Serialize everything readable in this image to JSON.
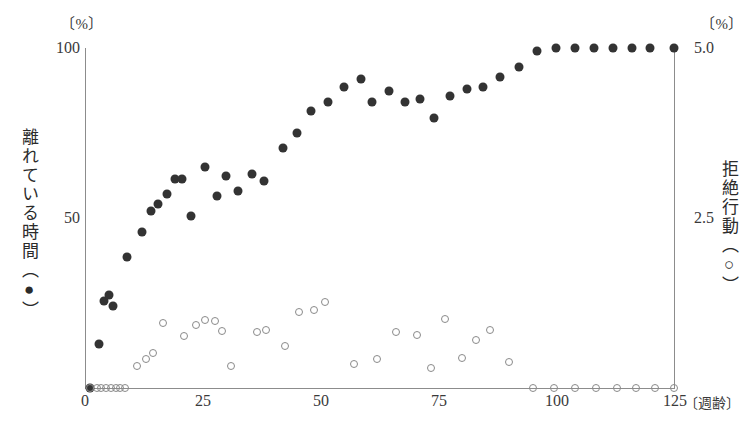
{
  "chart_data": {
    "type": "scatter",
    "title": "",
    "xlabel": "週齢",
    "xunit_label": "〔週齢〕",
    "xlim": [
      0,
      125
    ],
    "xticks": [
      0,
      25,
      50,
      75,
      100,
      125
    ],
    "xtick_labels": [
      "0",
      "25",
      "50",
      "75",
      "100",
      "125"
    ],
    "grid": false,
    "legend_position": "axis-titles",
    "axes": [
      {
        "id": "left",
        "unit": "〔%〕",
        "title": "離れている時間（●）",
        "title_text": "離れている時間",
        "marker": "●",
        "ylim": [
          0,
          100
        ],
        "yticks": [
          0,
          50,
          100
        ],
        "ytick_labels": [
          "0",
          "50",
          "100"
        ]
      },
      {
        "id": "right",
        "unit": "〔%〕",
        "title": "拒絶行動（○）",
        "title_text": "拒絶行動",
        "marker": "○",
        "ylim": [
          0,
          5.0
        ],
        "yticks": [
          2.5,
          5.0
        ],
        "ytick_labels": [
          "2.5",
          "5.0"
        ]
      }
    ],
    "series": [
      {
        "name": "離れている時間",
        "marker": "filled-circle",
        "color": "#333333",
        "axis": "left",
        "points": [
          [
            1.0,
            0.0
          ],
          [
            3.0,
            13.0
          ],
          [
            4.0,
            25.5
          ],
          [
            5.0,
            27.5
          ],
          [
            6.0,
            24.0
          ],
          [
            9.0,
            38.5
          ],
          [
            12.0,
            46.0
          ],
          [
            14.0,
            52.0
          ],
          [
            15.5,
            54.0
          ],
          [
            17.5,
            57.0
          ],
          [
            19.0,
            61.5
          ],
          [
            20.5,
            61.5
          ],
          [
            22.5,
            50.5
          ],
          [
            25.5,
            65.0
          ],
          [
            28.0,
            56.5
          ],
          [
            30.0,
            62.5
          ],
          [
            32.5,
            58.0
          ],
          [
            35.5,
            63.0
          ],
          [
            38.0,
            61.0
          ],
          [
            42.0,
            70.5
          ],
          [
            45.0,
            75.0
          ],
          [
            48.0,
            81.5
          ],
          [
            51.5,
            84.0
          ],
          [
            55.0,
            88.5
          ],
          [
            58.5,
            91.0
          ],
          [
            61.0,
            84.0
          ],
          [
            64.5,
            87.5
          ],
          [
            68.0,
            84.0
          ],
          [
            71.0,
            85.0
          ],
          [
            74.0,
            79.5
          ],
          [
            77.5,
            86.0
          ],
          [
            81.0,
            88.0
          ],
          [
            84.5,
            88.5
          ],
          [
            88.0,
            91.5
          ],
          [
            92.0,
            94.5
          ],
          [
            96.0,
            99.0
          ],
          [
            100.0,
            100.0
          ],
          [
            104.0,
            100.0
          ],
          [
            108.0,
            100.0
          ],
          [
            112.0,
            100.0
          ],
          [
            116.0,
            100.0
          ],
          [
            120.0,
            100.0
          ],
          [
            125.0,
            100.0
          ]
        ]
      },
      {
        "name": "拒絶行動",
        "marker": "open-circle",
        "color": "#8a8a8a",
        "axis": "right",
        "points": [
          [
            1.0,
            0.0
          ],
          [
            2.5,
            0.0
          ],
          [
            3.5,
            0.0
          ],
          [
            4.5,
            0.0
          ],
          [
            5.5,
            0.0
          ],
          [
            6.5,
            0.0
          ],
          [
            7.5,
            0.0
          ],
          [
            8.5,
            0.0
          ],
          [
            11.0,
            0.32
          ],
          [
            13.0,
            0.42
          ],
          [
            14.5,
            0.52
          ],
          [
            16.5,
            0.95
          ],
          [
            21.0,
            0.76
          ],
          [
            23.5,
            0.92
          ],
          [
            25.5,
            1.0
          ],
          [
            27.5,
            0.98
          ],
          [
            29.0,
            0.84
          ],
          [
            31.0,
            0.33
          ],
          [
            36.5,
            0.82
          ],
          [
            38.5,
            0.86
          ],
          [
            42.5,
            0.62
          ],
          [
            45.5,
            1.12
          ],
          [
            48.5,
            1.15
          ],
          [
            51.0,
            1.27
          ],
          [
            57.0,
            0.36
          ],
          [
            62.0,
            0.42
          ],
          [
            66.0,
            0.82
          ],
          [
            70.5,
            0.78
          ],
          [
            73.5,
            0.3
          ],
          [
            76.5,
            1.02
          ],
          [
            80.0,
            0.44
          ],
          [
            83.0,
            0.7
          ],
          [
            86.0,
            0.86
          ],
          [
            90.0,
            0.38
          ],
          [
            95.0,
            0.0
          ],
          [
            99.5,
            0.0
          ],
          [
            104.0,
            0.0
          ],
          [
            108.5,
            0.0
          ],
          [
            113.0,
            0.0
          ],
          [
            117.0,
            0.0
          ],
          [
            121.0,
            0.0
          ],
          [
            125.0,
            0.0
          ]
        ]
      }
    ]
  }
}
